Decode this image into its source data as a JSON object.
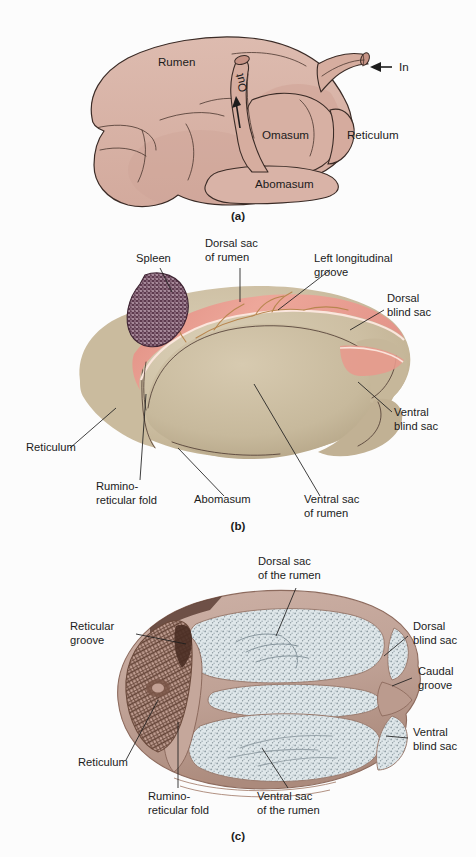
{
  "figure": {
    "background_color": "#fcfcfc"
  },
  "colors": {
    "panel_a_fill": "#d9b5a9",
    "panel_a_fill_shade": "#cea699",
    "panel_a_outline": "#3a2b26",
    "panel_b_fill": "#cdbfa3",
    "panel_b_fill_light": "#d8cbb1",
    "panel_b_fill_shade": "#bdae8f",
    "panel_b_groove_pink": "#e59a90",
    "panel_b_groove_light": "#f0c3b8",
    "spleen": "#5d3a4e",
    "spleen_speckle": "#c9aebd",
    "panel_c_wall": "#c4a79c",
    "panel_c_wall_dark": "#a98679",
    "panel_c_interior": "#dde5e8",
    "panel_c_speckle": "#8d9aa0",
    "panel_c_reticulum": "#6b4d40",
    "label_text": "#1b1b1b",
    "leader_line": "#1d1d1d"
  },
  "panel_a": {
    "letter": "(a)",
    "labels": [
      {
        "id": "rumen",
        "text": "Rumen",
        "x": 158,
        "y": 66,
        "anchor": "start"
      },
      {
        "id": "out",
        "text": "Out",
        "x": 245,
        "y": 80,
        "anchor": "middle",
        "rotate": -104
      },
      {
        "id": "in",
        "text": "In",
        "x": 400,
        "y": 71,
        "anchor": "start"
      },
      {
        "id": "omasum",
        "text": "Omasum",
        "x": 262,
        "y": 138,
        "anchor": "start"
      },
      {
        "id": "reticulum",
        "text": "Reticulum",
        "x": 348,
        "y": 138,
        "anchor": "start"
      },
      {
        "id": "abomasum",
        "text": "Abomasum",
        "x": 255,
        "y": 187,
        "anchor": "start"
      }
    ],
    "in_arrow": {
      "from_x": 393,
      "to_x": 370,
      "y": 67
    }
  },
  "panel_b": {
    "letter": "(b)",
    "labels": [
      {
        "id": "spleen",
        "lines": [
          "Spleen"
        ],
        "x": 136,
        "y": 32,
        "anchor": "start"
      },
      {
        "id": "dorsal-sac-of-rumen",
        "lines": [
          "Dorsal sac",
          "of rumen"
        ],
        "x": 205,
        "y": 17,
        "anchor": "start"
      },
      {
        "id": "left-longitudinal-groove",
        "lines": [
          "Left longitudinal",
          "groove"
        ],
        "x": 314,
        "y": 32,
        "anchor": "start"
      },
      {
        "id": "dorsal-blind-sac",
        "lines": [
          "Dorsal",
          "blind sac"
        ],
        "x": 387,
        "y": 72,
        "anchor": "start"
      },
      {
        "id": "ventral-blind-sac",
        "lines": [
          "Ventral",
          "blind sac"
        ],
        "x": 394,
        "y": 186,
        "anchor": "start"
      },
      {
        "id": "reticulum",
        "lines": [
          "Reticulum"
        ],
        "x": 26,
        "y": 221,
        "anchor": "start"
      },
      {
        "id": "rumino-reticular-fold",
        "lines": [
          "Rumino-",
          "reticular fold"
        ],
        "x": 96,
        "y": 260,
        "anchor": "start"
      },
      {
        "id": "abomasum",
        "lines": [
          "Abomasum"
        ],
        "x": 194,
        "y": 273,
        "anchor": "start"
      },
      {
        "id": "ventral-sac-of-rumen",
        "lines": [
          "Ventral sac",
          "of rumen"
        ],
        "x": 304,
        "y": 273,
        "anchor": "start"
      }
    ]
  },
  "panel_c": {
    "letter": "(c)",
    "labels": [
      {
        "id": "dorsal-sac-of-the-rumen",
        "lines": [
          "Dorsal sac",
          "of the rumen"
        ],
        "x": 258,
        "y": 25,
        "anchor": "start"
      },
      {
        "id": "reticular-groove",
        "lines": [
          "Reticular",
          "groove"
        ],
        "x": 70,
        "y": 90,
        "anchor": "start"
      },
      {
        "id": "dorsal-blind-sac",
        "lines": [
          "Dorsal",
          "blind sac"
        ],
        "x": 413,
        "y": 90,
        "anchor": "start"
      },
      {
        "id": "caudal-groove",
        "lines": [
          "Caudal",
          "groove"
        ],
        "x": 418,
        "y": 135,
        "anchor": "start"
      },
      {
        "id": "ventral-blind-sac",
        "lines": [
          "Ventral",
          "blind sac"
        ],
        "x": 413,
        "y": 196,
        "anchor": "start"
      },
      {
        "id": "reticulum",
        "lines": [
          "Reticulum"
        ],
        "x": 78,
        "y": 226,
        "anchor": "start"
      },
      {
        "id": "rumino-reticular-fold",
        "lines": [
          "Rumino-",
          "reticular fold"
        ],
        "x": 148,
        "y": 260,
        "anchor": "start"
      },
      {
        "id": "ventral-sac-of-the-rumen",
        "lines": [
          "Ventral sac",
          "of the rumen"
        ],
        "x": 257,
        "y": 260,
        "anchor": "start"
      }
    ]
  }
}
